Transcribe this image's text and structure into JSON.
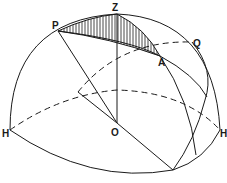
{
  "diagram": {
    "type": "celestial-sphere-hemisphere",
    "labels": {
      "zenith": "Z",
      "pole": "P",
      "star": "A",
      "equator_point": "Q",
      "center": "O",
      "horizon_left": "H",
      "horizon_right": "H"
    },
    "shaded_region": "spherical triangle PZA (hatched)",
    "colors": {
      "line": "#1a1a1a",
      "background": "#ffffff"
    }
  }
}
